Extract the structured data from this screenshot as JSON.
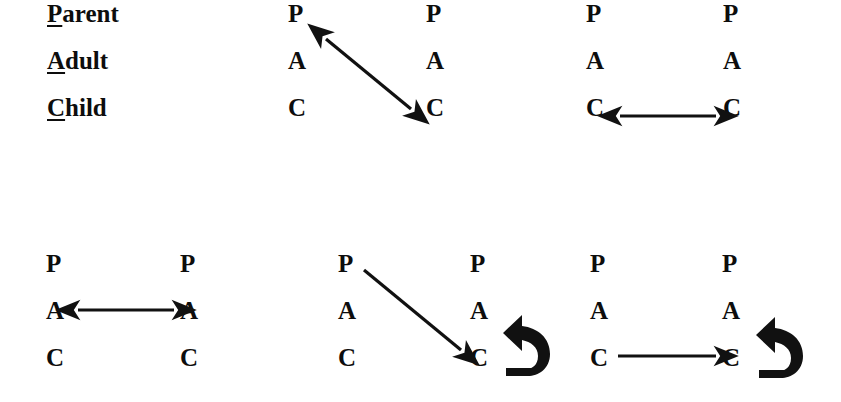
{
  "canvas": {
    "width": 841,
    "height": 402,
    "background": "#ffffff"
  },
  "ink_color": "#111111",
  "legend": {
    "name": "ego-state-legend",
    "items": [
      {
        "initial": "P",
        "rest": "arent",
        "full": "Parent"
      },
      {
        "initial": "A",
        "rest": "dult",
        "full": "Adult"
      },
      {
        "initial": "C",
        "rest": "hild",
        "full": "Child"
      }
    ]
  },
  "ego_states": {
    "parent": "P",
    "adult": "A",
    "child": "C"
  },
  "diagrams": [
    {
      "id": "diagram-1",
      "label": "crossed-transaction-parent-to-child",
      "left_column": {
        "parent": "P",
        "adult": "A",
        "child": "C"
      },
      "right_column": {
        "parent": "P",
        "adult": "A",
        "child": "C"
      },
      "arrows": [
        {
          "type": "diagonal",
          "heads": "double",
          "from": "left-parent",
          "to": "right-child",
          "style": "thin-line"
        }
      ]
    },
    {
      "id": "diagram-2",
      "label": "complementary-transaction-child-child",
      "left_column": {
        "parent": "P",
        "adult": "A",
        "child": "C"
      },
      "right_column": {
        "parent": "P",
        "adult": "A",
        "child": "C"
      },
      "arrows": [
        {
          "type": "horizontal",
          "heads": "double",
          "from": "left-child",
          "to": "right-child",
          "style": "thin-line"
        }
      ]
    },
    {
      "id": "diagram-3",
      "label": "complementary-transaction-adult-adult",
      "left_column": {
        "parent": "P",
        "adult": "A",
        "child": "C"
      },
      "right_column": {
        "parent": "P",
        "adult": "A",
        "child": "C"
      },
      "arrows": [
        {
          "type": "horizontal",
          "heads": "double",
          "from": "left-adult",
          "to": "right-adult",
          "style": "thin-line"
        }
      ]
    },
    {
      "id": "diagram-4",
      "label": "parent-to-child-with-response-hook",
      "left_column": {
        "parent": "P",
        "adult": "A",
        "child": "C"
      },
      "right_column": {
        "parent": "P",
        "adult": "A",
        "child": "C"
      },
      "arrows": [
        {
          "type": "diagonal",
          "heads": "single",
          "from": "left-parent",
          "to": "right-child",
          "style": "thin-line"
        },
        {
          "type": "curved-hook",
          "heads": "single",
          "from": "right-child",
          "to": "right-adult",
          "style": "thick-bold"
        }
      ]
    },
    {
      "id": "diagram-5",
      "label": "child-to-child-with-response-hook",
      "left_column": {
        "parent": "P",
        "adult": "A",
        "child": "C"
      },
      "right_column": {
        "parent": "P",
        "adult": "A",
        "child": "C"
      },
      "arrows": [
        {
          "type": "horizontal",
          "heads": "single",
          "from": "left-child",
          "to": "right-child",
          "style": "thin-line"
        },
        {
          "type": "curved-hook",
          "heads": "single",
          "from": "right-child",
          "to": "right-adult",
          "style": "thick-bold"
        }
      ]
    }
  ]
}
